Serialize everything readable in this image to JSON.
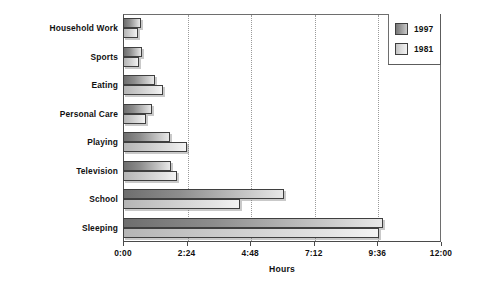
{
  "chart_data": {
    "type": "bar",
    "orientation": "horizontal",
    "title": "",
    "xlabel": "Hours",
    "ylabel": "",
    "xlim": [
      0,
      12
    ],
    "xtick_labels": [
      "0:00",
      "2:24",
      "4:48",
      "7:12",
      "9:36",
      "12:00"
    ],
    "xtick_values": [
      0,
      2.4,
      4.8,
      7.2,
      9.6,
      12
    ],
    "grid": true,
    "grid_axis": "x",
    "legend_position": "top-right",
    "categories": [
      "Household Work",
      "Sports",
      "Eating",
      "Personal Care",
      "Playing",
      "Television",
      "School",
      "Sleeping"
    ],
    "series": [
      {
        "name": "1997",
        "color": "#8d8d8d",
        "values": [
          0.68,
          0.72,
          1.2,
          1.08,
          1.77,
          1.8,
          6.08,
          9.83
        ],
        "value_labels": [
          "0:41",
          "0:43",
          "1:12",
          "1:05",
          "1:46",
          "1:48",
          "6:05",
          "9:50"
        ]
      },
      {
        "name": "1981",
        "color": "#dcdcdc",
        "values": [
          0.57,
          0.6,
          1.5,
          0.87,
          2.4,
          2.03,
          4.42,
          9.67
        ],
        "value_labels": [
          "0:34",
          "0:36",
          "1:30",
          "0:52",
          "2:24",
          "2:02",
          "4:25",
          "9:40"
        ]
      }
    ]
  },
  "legend": {
    "entries": [
      {
        "label": "1997"
      },
      {
        "label": "1981"
      }
    ]
  }
}
